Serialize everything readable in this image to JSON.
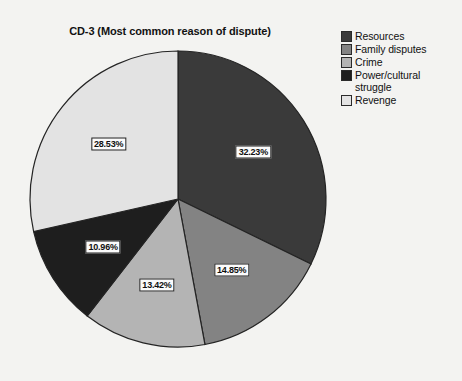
{
  "chart_data": {
    "type": "pie",
    "title": "CD-3 (Most common reason of dispute)",
    "xlabel": "",
    "ylabel": "",
    "legend_position": "right",
    "grid": false,
    "categories": [
      "Resources",
      "Family disputes",
      "Crime",
      "Power/cultural struggle",
      "Revenge"
    ],
    "values": [
      32.23,
      14.85,
      13.42,
      10.96,
      28.53
    ],
    "value_labels": [
      "32.23%",
      "14.85%",
      "13.42%",
      "10.96%",
      "28.53%"
    ],
    "colors": [
      "#3a3a3a",
      "#838383",
      "#b4b4b4",
      "#1e1e1e",
      "#e3e3e3"
    ],
    "start_angle_deg": 0,
    "direction": "clockwise",
    "total": 99.99
  },
  "legend": {
    "items": [
      {
        "label": "Resources",
        "color": "#3a3a3a"
      },
      {
        "label": "Family disputes",
        "color": "#838383"
      },
      {
        "label": "Crime",
        "color": "#b4b4b4"
      },
      {
        "label": "Power/cultural struggle",
        "color": "#1e1e1e"
      },
      {
        "label": "Revenge",
        "color": "#e3e3e3"
      }
    ]
  }
}
